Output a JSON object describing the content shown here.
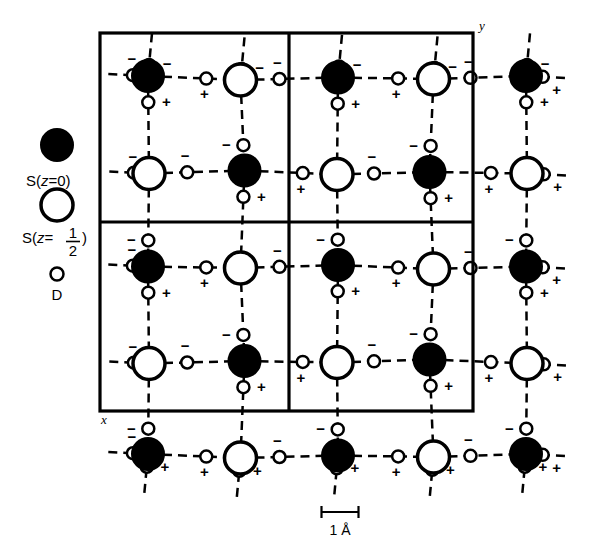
{
  "figure": {
    "kind": "crystal-structure-diagram",
    "background_color": "#ffffff",
    "ink_color": "#000000"
  },
  "legend": {
    "items": [
      {
        "symbol": "filled-circle",
        "label_prefix": "S(",
        "label_var": "z",
        "label_eq": "=0)",
        "full_label": "S(z=0)",
        "fill": "#000000",
        "stroke": "#000000",
        "radius": 16
      },
      {
        "symbol": "open-circle",
        "label_prefix": "S(",
        "label_var": "z",
        "label_eq": "=",
        "numerator": "1",
        "denominator": "2",
        "label_suffix": ")",
        "full_label": "S(z=1/2)",
        "fill": "#ffffff",
        "stroke": "#000000",
        "radius": 16
      },
      {
        "symbol": "small-open-circle",
        "full_label": "D",
        "fill": "#ffffff",
        "stroke": "#000000",
        "radius": 6
      }
    ]
  },
  "axes": {
    "y_label": "y",
    "x_label": "x"
  },
  "scale_bar": {
    "label": "1 Å",
    "value": 1,
    "unit": "Å",
    "length_px": 38
  },
  "cell_box": {
    "left": 100,
    "top": 33,
    "right": 473,
    "bottom": 411,
    "divider_x": 289,
    "divider_y": 222,
    "border_width": 3
  },
  "lattice": {
    "period_x": 94.5,
    "period_y": 94.5,
    "origin_x": 148,
    "origin_y": 78,
    "columns": 5,
    "rows": 5
  },
  "atoms": {
    "sulfur_z0": {
      "name": "S(z=0)",
      "fill": "#000000",
      "stroke": "#000000",
      "radius": 16,
      "stroke_width": 2
    },
    "sulfur_zhalf": {
      "name": "S(z=1/2)",
      "fill": "#ffffff",
      "stroke": "#000000",
      "radius": 16,
      "stroke_width": 3.5
    },
    "deuterium": {
      "name": "D",
      "fill": "#ffffff",
      "stroke": "#000000",
      "radius": 6,
      "stroke_width": 2.5
    }
  },
  "bonds": {
    "style": "dashed",
    "dash_pattern": "9 6",
    "width": 2.5,
    "color": "#000000"
  },
  "signs": {
    "positive": "+",
    "negative": "−"
  },
  "chart_data": {
    "type": "scatter",
    "title": "",
    "xlabel": "x",
    "ylabel": "y",
    "grid": false,
    "legend_position": "left-outside",
    "series": [
      {
        "name": "S(z=0)",
        "marker": "filled-circle",
        "color": "#000000"
      },
      {
        "name": "S(z=1/2)",
        "marker": "open-circle",
        "color": "#ffffff"
      },
      {
        "name": "D",
        "marker": "small-open-circle",
        "color": "#ffffff"
      }
    ],
    "unit_cell_sites": [
      {
        "site": "S-A",
        "type": "S(z=0)",
        "frac_x": 0.25,
        "frac_y": 0.24
      },
      {
        "site": "S-B",
        "type": "S(z=1/2)",
        "frac_x": 0.75,
        "frac_y": 0.27
      },
      {
        "site": "S-C",
        "type": "S(z=1/2)",
        "frac_x": 0.21,
        "frac_y": 0.75
      },
      {
        "site": "S-D",
        "type": "S(z=0)",
        "frac_x": 0.7,
        "frac_y": 0.78
      }
    ],
    "deuterium_sign_labels": [
      "+",
      "−"
    ]
  }
}
